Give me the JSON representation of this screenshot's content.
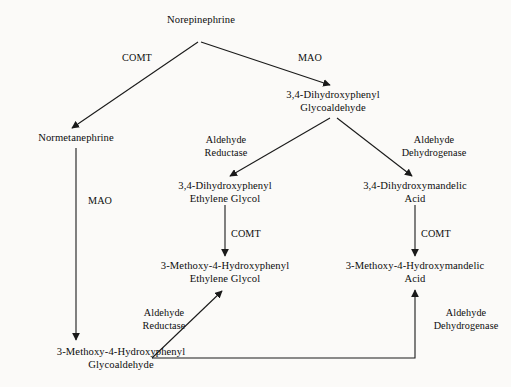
{
  "diagram": {
    "background_color": "#fbfaf8",
    "line_color": "#1a1a1a",
    "text_color": "#0d0d0d",
    "nodes": [
      {
        "id": "norepinephrine",
        "lines": [
          "Norepinephrine"
        ],
        "x": 201,
        "y": 20
      },
      {
        "id": "normetanephrine",
        "lines": [
          "Normetanephrine"
        ],
        "x": 76,
        "y": 138
      },
      {
        "id": "dhpg_aldehyde",
        "lines": [
          "3,4-Dihydroxyphenyl",
          "Glycoaldehyde"
        ],
        "x": 333,
        "y": 95
      },
      {
        "id": "dhpg_glycol",
        "lines": [
          "3,4-Dihydroxyphenyl",
          "Ethylene Glycol"
        ],
        "x": 225,
        "y": 186
      },
      {
        "id": "dhma",
        "lines": [
          "3,4-Dihydroxymandelic",
          "Acid"
        ],
        "x": 415,
        "y": 186
      },
      {
        "id": "mhpg",
        "lines": [
          "3-Methoxy-4-Hydroxyphenyl",
          "Ethylene Glycol"
        ],
        "x": 225,
        "y": 266
      },
      {
        "id": "vma",
        "lines": [
          "3-Methoxy-4-Hydroxymandelic",
          "Acid"
        ],
        "x": 415,
        "y": 266
      },
      {
        "id": "mhpg_aldehyde",
        "lines": [
          "3-Methoxy-4-Hydroxyphenyl",
          "Glycoaldehyde"
        ],
        "x": 121,
        "y": 352
      }
    ],
    "enzymes": [
      {
        "id": "comt-top-left",
        "lines": [
          "COMT"
        ],
        "x": 137,
        "y": 58
      },
      {
        "id": "mao-top-right",
        "lines": [
          "MAO"
        ],
        "x": 310,
        "y": 58
      },
      {
        "id": "aldehyde-reductase-upper",
        "lines": [
          "Aldehyde",
          "Reductase"
        ],
        "x": 226,
        "y": 140
      },
      {
        "id": "aldehyde-dehydrogenase-upper",
        "lines": [
          "Aldehyde",
          "Dehydrogenase"
        ],
        "x": 434,
        "y": 140
      },
      {
        "id": "mao-left",
        "lines": [
          "MAO"
        ],
        "x": 103,
        "y": 201
      },
      {
        "id": "comt-mid-left",
        "lines": [
          "COMT"
        ],
        "x": 248,
        "y": 234
      },
      {
        "id": "comt-mid-right",
        "lines": [
          "COMT"
        ],
        "x": 438,
        "y": 234
      },
      {
        "id": "aldehyde-reductase-lower",
        "lines": [
          "Aldehyde",
          "Reductase"
        ],
        "x": 164,
        "y": 313
      },
      {
        "id": "aldehyde-dehydrogenase-lower",
        "lines": [
          "Aldehyde",
          "Dehydrogenase"
        ],
        "x": 466,
        "y": 313
      }
    ],
    "edges": [
      {
        "id": "norepinephrine-to-normetanephrine",
        "enzyme": "COMT",
        "from": "norepinephrine",
        "to": "normetanephrine"
      },
      {
        "id": "norepinephrine-to-dhpg-aldehyde",
        "enzyme": "MAO",
        "from": "norepinephrine",
        "to": "dhpg_aldehyde"
      },
      {
        "id": "dhpg-aldehyde-to-dhpg-glycol",
        "enzyme": "Aldehyde Reductase",
        "from": "dhpg_aldehyde",
        "to": "dhpg_glycol"
      },
      {
        "id": "dhpg-aldehyde-to-dhma",
        "enzyme": "Aldehyde Dehydrogenase",
        "from": "dhpg_aldehyde",
        "to": "dhma"
      },
      {
        "id": "normetanephrine-to-mhpg-aldehyde",
        "enzyme": "MAO",
        "from": "normetanephrine",
        "to": "mhpg_aldehyde"
      },
      {
        "id": "dhpg-glycol-to-mhpg",
        "enzyme": "COMT",
        "from": "dhpg_glycol",
        "to": "mhpg"
      },
      {
        "id": "dhma-to-vma",
        "enzyme": "COMT",
        "from": "dhma",
        "to": "vma"
      },
      {
        "id": "mhpg-aldehyde-to-mhpg",
        "enzyme": "Aldehyde Reductase",
        "from": "mhpg_aldehyde",
        "to": "mhpg"
      },
      {
        "id": "mhpg-aldehyde-to-vma",
        "enzyme": "Aldehyde Dehydrogenase",
        "from": "mhpg_aldehyde",
        "to": "vma"
      }
    ]
  }
}
